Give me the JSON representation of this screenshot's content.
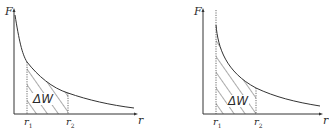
{
  "diagrams": [
    {
      "id": "left",
      "y_axis_label": "F",
      "x_axis_label": "r",
      "r1_label": "r",
      "r1_sub": "1",
      "r2_label": "r",
      "r2_sub": "2",
      "area_label": "ΔW",
      "description": "F vs r curve; hatched area between r1 and r2 under curve, r1 away from asymptote"
    },
    {
      "id": "right",
      "y_axis_label": "F",
      "x_axis_label": "r",
      "r1_label": "r",
      "r1_sub": "1",
      "r2_label": "r",
      "r2_sub": "2",
      "area_label": "ΔW",
      "description": "F vs r curve with vertical asymptote at r1 (dotted); hatched area between r1 and r2"
    }
  ],
  "colors": {
    "line": "#333333",
    "hatch": "#444444",
    "text": "#2a2a2a"
  }
}
